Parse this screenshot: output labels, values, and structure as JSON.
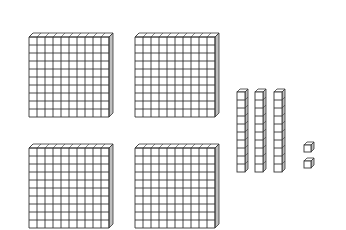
{
  "diagram": {
    "type": "base-ten-blocks",
    "stroke_color": "#333333",
    "side_color": "#bfbfbf",
    "hundreds": {
      "count": 4,
      "grid": 10
    },
    "tens": {
      "count": 3,
      "cells": 10
    },
    "ones": {
      "count": 2
    },
    "represented_value": 432
  }
}
